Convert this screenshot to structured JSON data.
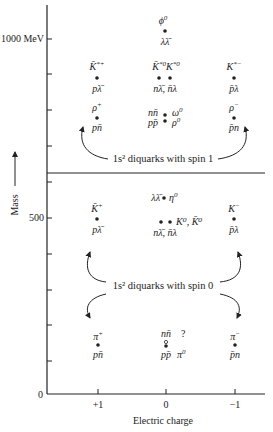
{
  "axes": {
    "y_label": "Mass",
    "x_label": "Electric charge",
    "y_ticks": [
      {
        "label": "1000 MeV",
        "y": 39
      },
      {
        "label": "",
        "y": 74
      },
      {
        "label": "",
        "y": 110
      },
      {
        "label": "",
        "y": 146
      },
      {
        "label": "",
        "y": 182
      },
      {
        "label": "500",
        "y": 218
      },
      {
        "label": "",
        "y": 254
      },
      {
        "label": "",
        "y": 290
      },
      {
        "label": "",
        "y": 325
      },
      {
        "label": "",
        "y": 361
      },
      {
        "label": "0",
        "y": 394
      }
    ],
    "x_ticks": [
      {
        "label": "+1",
        "x": 98
      },
      {
        "label": "0",
        "x": 166
      },
      {
        "label": "−1",
        "x": 235
      }
    ]
  },
  "regions": {
    "upper_note": "1s² diquarks with spin 1",
    "lower_note": "1s² diquarks with spin 0"
  },
  "particles": {
    "phi0": {
      "name": "ϕ0",
      "sym": "ϕ",
      "sup": "0",
      "quark": "λλ̄"
    },
    "Kstar_plus": {
      "sym": "K̄",
      "sup": "*+",
      "quark": "pλ̄"
    },
    "Kstar0": {
      "sym": "K̄",
      "sup": "*0",
      "sym2": "K",
      "sup2": "*0",
      "quark": "nλ̄, n̄λ"
    },
    "Kstar_minus": {
      "sym": "K",
      "sup": "*−",
      "quark": "p̄λ"
    },
    "rho_plus": {
      "sym": "ρ",
      "sup": "+",
      "quark": "pn̄"
    },
    "omega_rho0": {
      "quark_top": "nn̄",
      "quark_bottom": "pp̄",
      "sym_top": "ω",
      "sup_top": "0",
      "sym_bottom": "ρ",
      "sup_bottom": "0"
    },
    "rho_minus": {
      "sym": "ρ",
      "sup": "−",
      "quark": "p̄n"
    },
    "eta0": {
      "quark": "λλ̄",
      "sym": "η",
      "sup": "0"
    },
    "K_plus": {
      "sym": "K̄",
      "sup": "+",
      "quark": "pλ̄"
    },
    "K0": {
      "label": "K⁰, K̄⁰",
      "quark": "nλ̄, n̄λ"
    },
    "K_minus": {
      "sym": "K",
      "sup": "−",
      "quark": "p̄λ"
    },
    "pi_plus": {
      "sym": "π",
      "sup": "+",
      "quark": "pn̄"
    },
    "pi0": {
      "quark_top": "nn̄",
      "unknown": "?",
      "quark_bottom": "pp̄",
      "sym": "π",
      "sup": "0"
    },
    "pi_minus": {
      "sym": "π",
      "sup": "−",
      "quark": "p̄n"
    }
  },
  "colors": {
    "ink": "#222222",
    "background": "#ffffff"
  }
}
